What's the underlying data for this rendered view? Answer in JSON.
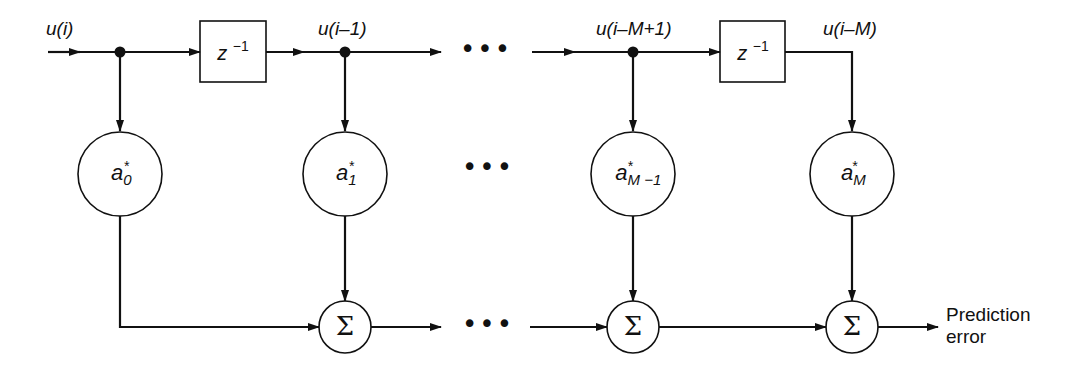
{
  "diagram": {
    "colors": {
      "line": "#111111",
      "background": "#ffffff"
    },
    "signals": {
      "input": "u(i)",
      "tap1": "u(i–1)",
      "tapM1": "u(i–M+1)",
      "tapM": "u(i–M)"
    },
    "delay": {
      "base": "z",
      "exp": "−1"
    },
    "coefficients": [
      {
        "base": "a",
        "sub": "0",
        "sup": "*"
      },
      {
        "base": "a",
        "sub": "1",
        "sup": "*"
      },
      {
        "base": "a",
        "sub": "M −1",
        "sup": "*"
      },
      {
        "base": "a",
        "sub": "M",
        "sup": "*"
      }
    ],
    "summer_symbol": "Σ",
    "ellipsis": "•••",
    "output": {
      "line1": "Prediction",
      "line2": "error"
    }
  }
}
